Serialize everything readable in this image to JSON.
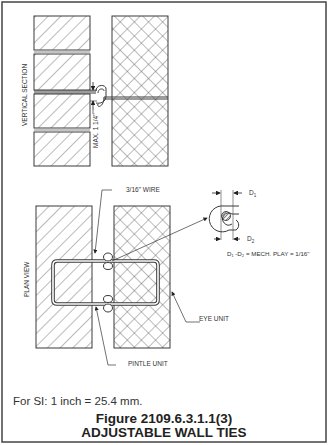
{
  "figure": {
    "number": "Figure 2109.6.3.1.1(3)",
    "title": "ADJUSTABLE WALL TIES",
    "si_note": "For SI:   1 inch = 25.4 mm."
  },
  "views": {
    "vertical_section": {
      "label": "VERTICAL SECTION",
      "dimension_label": "MAX. 1 1/4\""
    },
    "plan_view": {
      "label": "PLAN VIEW",
      "callouts": {
        "wire": "3/16\" WIRE",
        "eye_unit": "EYE UNIT",
        "pintle_unit": "PINTLE UNIT"
      }
    },
    "detail": {
      "d1_label": "D",
      "d1_sub": "1",
      "d2_label": "D",
      "d2_sub": "2",
      "equation": "D₁ -D₂ = MECH. PLAY = 1/16\""
    }
  },
  "colors": {
    "line": "#3a3a3a",
    "hatch": "#555555",
    "border": "#444444",
    "background": "#ffffff"
  }
}
